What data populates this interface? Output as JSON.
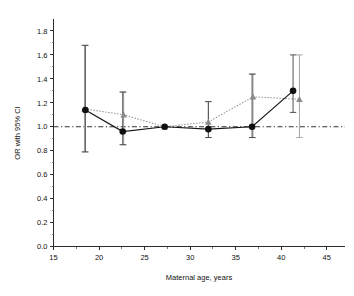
{
  "chart_data": {
    "type": "scatter",
    "title": "",
    "subtitle": "",
    "xlabel": "Maternal age, years",
    "ylabel": "OR with 95% CI",
    "xlim": [
      15,
      47
    ],
    "ylim": [
      0.0,
      1.9
    ],
    "grid": false,
    "legend_position": "none",
    "xticks": [
      15,
      20,
      25,
      30,
      35,
      40,
      45
    ],
    "xtick_labels": [
      "15",
      "20",
      "25",
      "30",
      "35",
      "40",
      "45"
    ],
    "xminorticks": [
      17.5,
      22.5,
      27.5,
      32.5,
      37.5,
      42.5
    ],
    "yticks": [
      0.0,
      0.2,
      0.4,
      0.6,
      0.8,
      1.0,
      1.2,
      1.4,
      1.6,
      1.8
    ],
    "ytick_labels": [
      "0.0",
      "0.2",
      "0.4",
      "0.6",
      "0.8",
      "1.0",
      "1.2",
      "1.4",
      "1.6",
      "1.8"
    ],
    "reference_line": {
      "orientation": "horizontal",
      "value": 1.0,
      "style": "dash-dot",
      "color": "#1a1a1a"
    },
    "series": [
      {
        "name": "circle-series",
        "marker": "circle",
        "line_style": "solid",
        "color": "#101010",
        "error_color": "#4a4a4a",
        "x": [
          18.5,
          22.6,
          27.2,
          32.0,
          36.8,
          41.3
        ],
        "values": [
          1.14,
          0.96,
          1.0,
          0.98,
          1.0,
          1.3
        ],
        "ci_low": [
          0.79,
          0.85,
          null,
          0.91,
          0.91,
          1.12
        ],
        "ci_high": [
          1.68,
          1.29,
          null,
          1.21,
          1.44,
          1.6
        ]
      },
      {
        "name": "triangle-series",
        "marker": "triangle",
        "line_style": "dotted",
        "color": "#8a8a8a",
        "error_color": "#a0a0a0",
        "x": [
          18.4,
          22.7,
          27.2,
          32.0,
          36.9,
          42.0
        ],
        "values": [
          1.15,
          1.1,
          1.0,
          1.04,
          1.25,
          1.23
        ],
        "ci_low": [
          0.79,
          0.85,
          null,
          0.91,
          0.91,
          0.91
        ],
        "ci_high": [
          1.68,
          1.29,
          null,
          1.21,
          1.44,
          1.6
        ]
      }
    ]
  },
  "axes": {
    "x_title": "Maternal age, years",
    "y_title": "OR with 95% CI"
  }
}
